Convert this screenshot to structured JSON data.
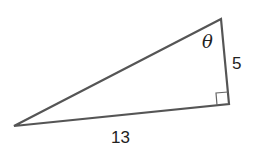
{
  "diagram": {
    "type": "right-triangle",
    "labels": {
      "angle": "θ",
      "opposite_side": "5",
      "hypotenuse_or_base": "13"
    },
    "colors": {
      "stroke": "#555555",
      "text": "#222222"
    }
  }
}
